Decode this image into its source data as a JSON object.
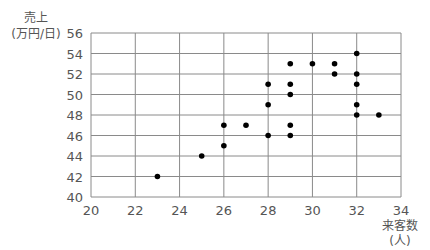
{
  "chart_data": {
    "type": "scatter",
    "title": "",
    "xlabel": "来客数",
    "xlabel_unit": "(人)",
    "ylabel": "売上",
    "ylabel_unit": "(万円/日)",
    "xlim": [
      20,
      34
    ],
    "ylim": [
      40,
      56
    ],
    "xticks": [
      20,
      22,
      24,
      26,
      28,
      30,
      32,
      34
    ],
    "yticks": [
      40,
      42,
      44,
      46,
      48,
      50,
      52,
      54,
      56
    ],
    "grid": true,
    "legend": null,
    "points": [
      {
        "x": 23,
        "y": 42
      },
      {
        "x": 25,
        "y": 44
      },
      {
        "x": 26,
        "y": 45
      },
      {
        "x": 26,
        "y": 47
      },
      {
        "x": 27,
        "y": 47
      },
      {
        "x": 28,
        "y": 46
      },
      {
        "x": 28,
        "y": 49
      },
      {
        "x": 28,
        "y": 51
      },
      {
        "x": 29,
        "y": 46
      },
      {
        "x": 29,
        "y": 47
      },
      {
        "x": 29,
        "y": 50
      },
      {
        "x": 29,
        "y": 51
      },
      {
        "x": 29,
        "y": 53
      },
      {
        "x": 30,
        "y": 53
      },
      {
        "x": 31,
        "y": 52
      },
      {
        "x": 31,
        "y": 53
      },
      {
        "x": 32,
        "y": 48
      },
      {
        "x": 32,
        "y": 49
      },
      {
        "x": 32,
        "y": 51
      },
      {
        "x": 32,
        "y": 52
      },
      {
        "x": 32,
        "y": 54
      },
      {
        "x": 33,
        "y": 48
      }
    ],
    "colors": {
      "point": "#000000",
      "grid": "#8a8a8a",
      "text": "#555555"
    }
  }
}
